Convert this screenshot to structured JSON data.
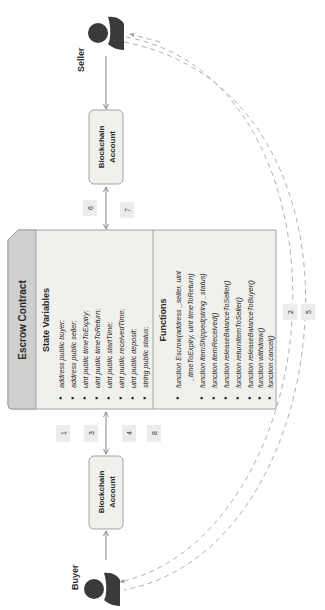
{
  "actors": {
    "seller": {
      "label": "Seller"
    },
    "buyer": {
      "label": "Buyer"
    }
  },
  "accounts": {
    "seller": {
      "line1": "Blockchain",
      "line2": "Account"
    },
    "buyer": {
      "line1": "Blockchain",
      "line2": "Account"
    }
  },
  "contract": {
    "title": "Escrow Contract",
    "state_heading": "State Variables",
    "state_variables": [
      "address public buyer;",
      "address public seller;",
      "uint public timeToExpiry;",
      "uint public timeToReturn;",
      "uint public startTime;",
      "uint public receivedTime;",
      "uint public deposit;",
      "string public status;"
    ],
    "functions_heading": "Functions",
    "functions": [
      "function Escrow(address _seller, uint",
      "_timeToExpiry, uint timeToReturn)",
      "function itemShipped(string _status)",
      "function itemReceived()",
      "function releaseBalanceToSeller()",
      "function returnItemToSeller()",
      "function releaseBalanceToBuyer()",
      "function withdraw()",
      "function cancel()"
    ]
  },
  "step_labels": {
    "s1": "1",
    "s2": "2",
    "s3": "3",
    "s4": "4",
    "s5": "5",
    "s6": "6",
    "s7": "7",
    "s8": "8"
  },
  "colors": {
    "person": "#3a3a3a",
    "box_fill": "#f0f0ec",
    "box_stroke": "#9a9a9a",
    "header_fill": "#cfcfcf",
    "badge_fill": "#ececec",
    "line": "#7a7a7a",
    "dashed": "#a8a8a8",
    "text": "#2a2a2a"
  }
}
